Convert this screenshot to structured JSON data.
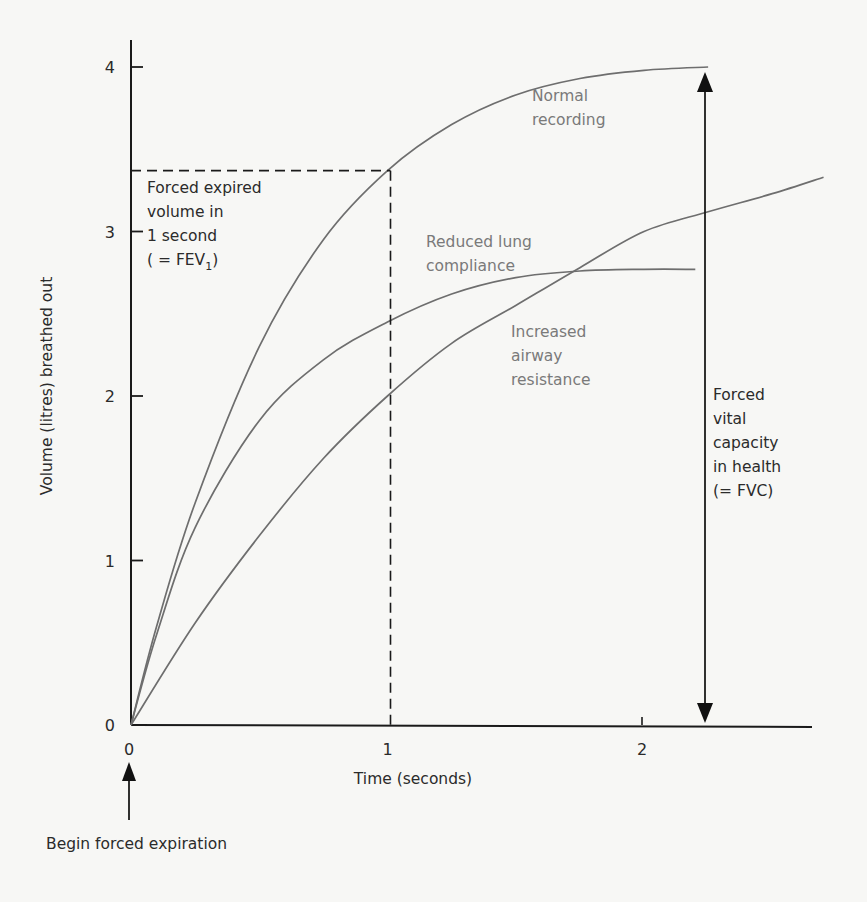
{
  "chart_data": {
    "type": "line",
    "title": "",
    "xlabel": "Time (seconds)",
    "ylabel": "Volume (litres) breathed out",
    "xlim": [
      0,
      2.65
    ],
    "ylim": [
      0,
      4
    ],
    "x_ticks": [
      "0",
      "1",
      "2"
    ],
    "y_ticks": [
      "0",
      "1",
      "2",
      "3",
      "4"
    ],
    "grid": false,
    "series": [
      {
        "name": "Normal recording",
        "x": [
          0,
          0.1,
          0.25,
          0.5,
          0.75,
          1.0,
          1.25,
          1.5,
          1.75,
          2.0,
          2.25
        ],
        "values": [
          0,
          0.6,
          1.35,
          2.3,
          2.95,
          3.37,
          3.65,
          3.83,
          3.93,
          3.98,
          4.0
        ]
      },
      {
        "name": "Reduced lung compliance",
        "x": [
          0,
          0.1,
          0.25,
          0.5,
          0.75,
          1.0,
          1.25,
          1.5,
          1.75,
          2.0,
          2.2
        ],
        "values": [
          0,
          0.55,
          1.2,
          1.85,
          2.22,
          2.45,
          2.62,
          2.72,
          2.76,
          2.77,
          2.77
        ]
      },
      {
        "name": "Increased airway resistance",
        "x": [
          0,
          0.25,
          0.5,
          0.75,
          1.0,
          1.25,
          1.5,
          1.75,
          2.0,
          2.25,
          2.5,
          2.7
        ],
        "values": [
          0,
          0.62,
          1.15,
          1.62,
          2.0,
          2.32,
          2.55,
          2.78,
          3.0,
          3.12,
          3.23,
          3.33
        ]
      }
    ],
    "annotations": {
      "fev1": {
        "x": 1.0,
        "y": 3.37,
        "label_lines": [
          "Forced expired",
          "volume in",
          "1 second",
          "( = FEV",
          "1",
          ")"
        ]
      },
      "fvc": {
        "x": 2.25,
        "y_from": 0,
        "y_to": 4.0,
        "label_lines": [
          "Forced",
          "vital",
          "capacity",
          "in health",
          "(= FVC)"
        ]
      },
      "start": {
        "x": 0,
        "label": "Begin forced expiration"
      }
    }
  },
  "labels": {
    "normal": [
      "Normal",
      "recording"
    ],
    "compliance": [
      "Reduced lung",
      "compliance"
    ],
    "resistance": [
      "Increased",
      "airway",
      "resistance"
    ]
  },
  "colors": {
    "axis": "#1a1a1a",
    "curve": "#6e6e6e",
    "curve_label": "#7a7a7a",
    "text": "#2b2b2b",
    "background": "#f7f7f5"
  }
}
